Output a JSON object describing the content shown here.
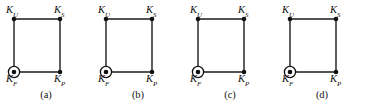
{
  "figure": {
    "type": "graph-diagram-series",
    "background_color": "#ffffff",
    "line_color": "#1a1a1a",
    "node_color": "#111111",
    "panel_count": 4
  },
  "node_labels": {
    "top_left": {
      "base": "K",
      "sub": "U"
    },
    "top_right": {
      "base": "K",
      "sub": "S"
    },
    "bottom_left": {
      "base": "K",
      "sub": "F"
    },
    "bottom_right": {
      "base": "K",
      "sub": "P"
    }
  },
  "panels": [
    {
      "id": "a",
      "caption": "(a)",
      "nodes": [
        {
          "name": "K_U",
          "position": "top-left",
          "marker": "filled-dot"
        },
        {
          "name": "K_S",
          "position": "top-right",
          "marker": "filled-dot"
        },
        {
          "name": "K_F",
          "position": "bottom-left",
          "marker": "circled-dot"
        },
        {
          "name": "K_P",
          "position": "bottom-right",
          "marker": "filled-dot"
        }
      ],
      "edges": [
        {
          "from": "K_U",
          "to": "K_S"
        },
        {
          "from": "K_U",
          "to": "K_F"
        },
        {
          "from": "K_F",
          "to": "K_P"
        },
        {
          "from": "K_S",
          "to": "K_P"
        }
      ]
    },
    {
      "id": "b",
      "caption": "(b)",
      "nodes": [
        {
          "name": "K_U",
          "position": "top-left",
          "marker": "filled-dot"
        },
        {
          "name": "K_S",
          "position": "top-right",
          "marker": "filled-dot"
        },
        {
          "name": "K_F",
          "position": "bottom-left",
          "marker": "circled-dot"
        },
        {
          "name": "K_P",
          "position": "bottom-right",
          "marker": "filled-dot"
        }
      ],
      "edges": [
        {
          "from": "K_U",
          "to": "K_S"
        },
        {
          "from": "K_U",
          "to": "K_F"
        },
        {
          "from": "K_F",
          "to": "K_P"
        },
        {
          "from": "K_S",
          "to": "K_P"
        }
      ]
    },
    {
      "id": "c",
      "caption": "(c)",
      "nodes": [
        {
          "name": "K_U",
          "position": "top-left",
          "marker": "filled-dot"
        },
        {
          "name": "K_S",
          "position": "top-right",
          "marker": "filled-dot"
        },
        {
          "name": "K_F",
          "position": "bottom-left",
          "marker": "circled-dot"
        },
        {
          "name": "K_P",
          "position": "bottom-right",
          "marker": "filled-dot"
        }
      ],
      "edges": [
        {
          "from": "K_U",
          "to": "K_S"
        },
        {
          "from": "K_U",
          "to": "K_F"
        },
        {
          "from": "K_F",
          "to": "K_P"
        },
        {
          "from": "K_S",
          "to": "K_P"
        }
      ]
    },
    {
      "id": "d",
      "caption": "(d)",
      "nodes": [
        {
          "name": "K_U",
          "position": "top-left",
          "marker": "filled-dot"
        },
        {
          "name": "K_S",
          "position": "top-right",
          "marker": "filled-dot"
        },
        {
          "name": "K_F",
          "position": "bottom-left",
          "marker": "circled-dot"
        },
        {
          "name": "K_P",
          "position": "bottom-right",
          "marker": "filled-dot"
        }
      ],
      "edges": [
        {
          "from": "K_U",
          "to": "K_S"
        },
        {
          "from": "K_U",
          "to": "K_F"
        },
        {
          "from": "K_F",
          "to": "K_P"
        },
        {
          "from": "K_S",
          "to": "K_P"
        }
      ]
    }
  ]
}
